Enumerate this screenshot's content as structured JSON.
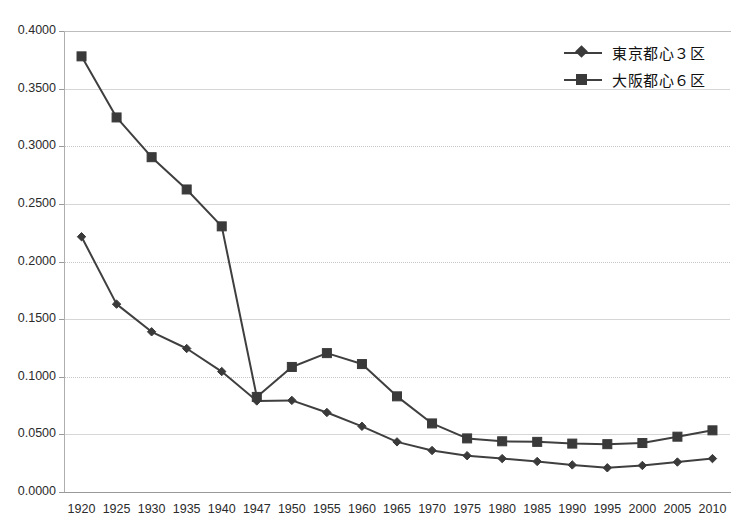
{
  "chart_data": {
    "type": "line",
    "title": "",
    "subtitle": "",
    "xlabel": "",
    "ylabel": "",
    "categories": [
      "1920",
      "1925",
      "1930",
      "1935",
      "1940",
      "1947",
      "1950",
      "1955",
      "1960",
      "1965",
      "1970",
      "1975",
      "1980",
      "1985",
      "1990",
      "1995",
      "2000",
      "2005",
      "2010"
    ],
    "ylim": [
      0.0,
      0.4
    ],
    "yticks": [
      "0.0000",
      "0.0500",
      "0.1000",
      "0.1500",
      "0.2000",
      "0.2500",
      "0.3000",
      "0.3500",
      "0.4000"
    ],
    "ytick_values": [
      0.0,
      0.05,
      0.1,
      0.15,
      0.2,
      0.25,
      0.3,
      0.35,
      0.4
    ],
    "grid": true,
    "legend_position": "top-right",
    "series": [
      {
        "name": "東京都心３区",
        "marker": "diamond",
        "color": "#3a3a3a",
        "values": [
          0.2215,
          0.163,
          0.139,
          0.1245,
          0.1045,
          0.079,
          0.0795,
          0.069,
          0.057,
          0.0435,
          0.036,
          0.0315,
          0.029,
          0.0265,
          0.0235,
          0.021,
          0.023,
          0.026,
          0.029
        ]
      },
      {
        "name": "大阪都心６区",
        "marker": "square",
        "color": "#3a3a3a",
        "values": [
          0.378,
          0.325,
          0.2905,
          0.2625,
          0.2305,
          0.0825,
          0.1085,
          0.1205,
          0.111,
          0.083,
          0.0595,
          0.0465,
          0.044,
          0.0435,
          0.042,
          0.0415,
          0.0425,
          0.048,
          0.0535
        ]
      }
    ]
  },
  "legend": {
    "items": [
      {
        "label": "東京都心３区",
        "marker": "diamond"
      },
      {
        "label": "大阪都心６区",
        "marker": "square"
      }
    ]
  },
  "colors": {
    "series_line": "#3f3f3f",
    "marker_fill": "#3a3a3a",
    "gridline": "#d6d6d6",
    "axis": "#9a9a9a",
    "background": "#ffffff",
    "text": "#2b2b2b"
  }
}
